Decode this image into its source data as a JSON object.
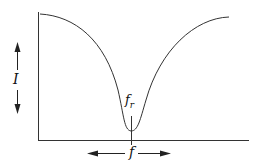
{
  "diagram": {
    "type": "resonance-curve",
    "curve_shape": "V-shaped dip (series resonance minimum)",
    "y_axis_label": "I",
    "x_axis_label": "f",
    "marker_label": "f",
    "marker_subscript": "r",
    "colors": {
      "line": "#333333",
      "background": "#ffffff"
    }
  }
}
